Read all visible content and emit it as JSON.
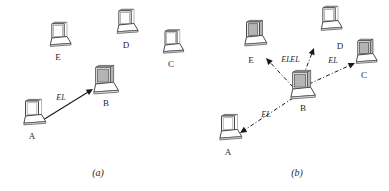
{
  "figure": {
    "width": 389,
    "height": 191,
    "background_color": "#ffffff",
    "line_color": "#1a1a1a",
    "shade_color": "#b4b4b4"
  },
  "panels": [
    {
      "id": "a",
      "caption": "(a)",
      "caption_pos": {
        "x": 98,
        "y": 176
      },
      "link_style": "solid",
      "nodes": [
        {
          "id": "A",
          "label": "A",
          "x": 32,
          "y": 116,
          "scale": 1.0,
          "shaded": false,
          "label_pos": {
            "x": 32,
            "y": 139
          }
        },
        {
          "id": "B",
          "label": "B",
          "x": 103,
          "y": 84,
          "scale": 1.12,
          "shaded": true,
          "label_pos": {
            "x": 106,
            "y": 106
          }
        },
        {
          "id": "C",
          "label": "C",
          "x": 171,
          "y": 45,
          "scale": 0.92,
          "shaded": false,
          "label_pos": {
            "x": 171,
            "y": 67
          }
        },
        {
          "id": "D",
          "label": "D",
          "x": 125,
          "y": 25,
          "scale": 0.95,
          "shaded": false,
          "label_pos": {
            "x": 126,
            "y": 48
          }
        },
        {
          "id": "E",
          "label": "E",
          "x": 58,
          "y": 38,
          "scale": 0.95,
          "shaded": false,
          "label_pos": {
            "x": 58,
            "y": 60
          }
        }
      ],
      "links": [
        {
          "from": "A",
          "to": "B",
          "label": "EL",
          "style": "solid",
          "x1": 38,
          "y1": 123,
          "x2": 93,
          "y2": 89,
          "label_pos": {
            "x": 61,
            "y": 100
          }
        }
      ]
    },
    {
      "id": "b",
      "caption": "(b)",
      "caption_pos": {
        "x": 297,
        "y": 176
      },
      "link_style": "dashed",
      "nodes": [
        {
          "id": "A",
          "label": "A",
          "x": 228,
          "y": 131,
          "scale": 1.0,
          "shaded": false,
          "label_pos": {
            "x": 228,
            "y": 155
          }
        },
        {
          "id": "B",
          "label": "B",
          "x": 300,
          "y": 89,
          "scale": 1.12,
          "shaded": true,
          "label_pos": {
            "x": 303,
            "y": 111
          }
        },
        {
          "id": "C",
          "label": "C",
          "x": 364,
          "y": 55,
          "scale": 0.95,
          "shaded": true,
          "label_pos": {
            "x": 364,
            "y": 78
          }
        },
        {
          "id": "D",
          "label": "D",
          "x": 329,
          "y": 22,
          "scale": 0.95,
          "shaded": false,
          "label_pos": {
            "x": 340,
            "y": 49
          }
        },
        {
          "id": "E",
          "label": "E",
          "x": 253,
          "y": 37,
          "scale": 1.0,
          "shaded": true,
          "label_pos": {
            "x": 251,
            "y": 63
          }
        }
      ],
      "links": [
        {
          "from": "B",
          "to": "A",
          "label": "EL",
          "style": "dashed",
          "x1": 293,
          "y1": 98,
          "x2": 240,
          "y2": 133,
          "label_pos": {
            "x": 266,
            "y": 117
          }
        },
        {
          "from": "B",
          "to": "E",
          "label": "EL",
          "style": "dashed",
          "x1": 293,
          "y1": 87,
          "x2": 266,
          "y2": 58,
          "label_pos": {
            "x": 286,
            "y": 62
          }
        },
        {
          "from": "B",
          "to": "D",
          "label": "EL",
          "style": "dashed",
          "x1": 300,
          "y1": 84,
          "x2": 314,
          "y2": 48,
          "label_pos": {
            "x": 295,
            "y": 62
          }
        },
        {
          "from": "B",
          "to": "C",
          "label": "EL",
          "style": "dashed",
          "x1": 309,
          "y1": 84,
          "x2": 355,
          "y2": 63,
          "label_pos": {
            "x": 333,
            "y": 63
          }
        }
      ]
    }
  ],
  "legend": {
    "edge_label_text": "EL",
    "node_ids": [
      "A",
      "B",
      "C",
      "D",
      "E"
    ]
  }
}
